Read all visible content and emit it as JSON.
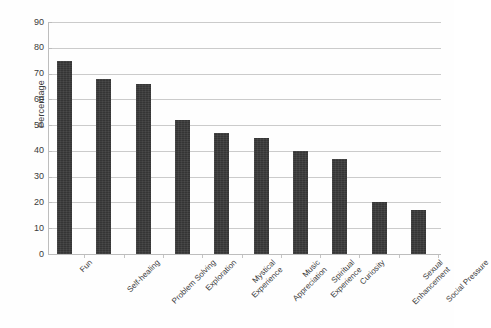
{
  "chart_data": {
    "type": "bar",
    "title": "",
    "subtitle": "",
    "xlabel": "",
    "ylabel": "Percentage",
    "categories": [
      "Fun",
      "Self-healing",
      "Problem Solving",
      "Exploration",
      "Mystical Experience",
      "Music Appreciation",
      "Spiritual Experience",
      "Curiosity",
      "Sexual Enhancement",
      "Social Pressure"
    ],
    "category_lines": [
      [
        "Fun"
      ],
      [
        "Self-healing"
      ],
      [
        "Problem Solving"
      ],
      [
        "Exploration"
      ],
      [
        "Mystical",
        "Experience"
      ],
      [
        "Music",
        "Appreciation"
      ],
      [
        "Spiritual",
        "Experience"
      ],
      [
        "Curiosity"
      ],
      [
        "Sexual",
        "Enhancement"
      ],
      [
        "Social Pressure"
      ]
    ],
    "values": [
      75,
      68,
      66,
      52,
      47,
      45,
      40,
      37,
      20,
      17
    ],
    "ylim": [
      0,
      90
    ],
    "ytick_step": 10,
    "ytick_labels": [
      "0",
      "10",
      "20",
      "30",
      "40",
      "50",
      "60",
      "70",
      "80",
      "90"
    ],
    "grid": true,
    "grid_axis": "y",
    "legend": false,
    "legend_position": "none",
    "bar_color": "#3a3a3a",
    "gridline_color": "#cbcbcb",
    "axis_color": "#bdbdbd",
    "background_color": "#fefefe",
    "text_color": "#3b3b3b",
    "xtick_label_rotation": -45
  }
}
